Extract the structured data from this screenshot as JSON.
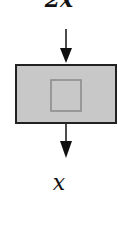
{
  "diagram": {
    "input_label": "2x",
    "output_label": "x",
    "block": {
      "fill": "#c8c8c8",
      "border": "#222222",
      "inner_border": "#888888"
    },
    "arrow_color": "#111111"
  }
}
